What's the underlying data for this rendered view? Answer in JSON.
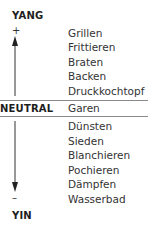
{
  "diagram": {
    "top_pole": {
      "label": "YANG",
      "sign": "+"
    },
    "neutral": {
      "label": "NEUTRAL",
      "method": "Garen"
    },
    "bottom_pole": {
      "label": "YIN",
      "sign": "–"
    },
    "yang_methods": [
      "Grillen",
      "Frittieren",
      "Braten",
      "Backen",
      "Druckkochtopf"
    ],
    "yin_methods": [
      "Dünsten",
      "Sieden",
      "Blanchieren",
      "Pochieren",
      "Dämpfen",
      "Wasserbad"
    ],
    "arrows": {
      "up": "arrow-up-icon",
      "down": "arrow-down-icon"
    },
    "colors": {
      "text": "#2a2a2a",
      "rule": "#8a8a8a"
    }
  }
}
